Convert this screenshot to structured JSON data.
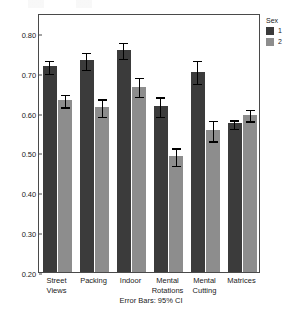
{
  "chart_data": {
    "type": "bar",
    "title": "",
    "xlabel": "",
    "ylabel": "Mean",
    "ylim": [
      0.2,
      0.85
    ],
    "ytick_values": [
      0.8,
      0.7,
      0.6,
      0.5,
      0.4,
      0.3,
      0.2
    ],
    "ytick_labels": [
      "0.80",
      "0.70",
      "0.60",
      "0.50",
      "0.40",
      "0.30",
      "0.20"
    ],
    "grid": false,
    "legend_position": "right",
    "legend_title": "Sex",
    "categories": [
      "Street Views",
      "Packing",
      "Indoor",
      "Mental Rotations",
      "Mental Cutting",
      "Matrices"
    ],
    "category_lines": [
      [
        "Street",
        "Views"
      ],
      [
        "Packing"
      ],
      [
        "Indoor"
      ],
      [
        "Mental",
        "Rotations"
      ],
      [
        "Mental",
        "Cutting"
      ],
      [
        "Matrices"
      ]
    ],
    "series": [
      {
        "name": "1",
        "color": "#3b3b3b",
        "values": [
          0.716,
          0.732,
          0.757,
          0.617,
          0.703,
          0.573
        ],
        "ci_low": [
          0.7,
          0.71,
          0.738,
          0.592,
          0.675,
          0.563
        ],
        "ci_high": [
          0.733,
          0.754,
          0.778,
          0.642,
          0.733,
          0.584
        ]
      },
      {
        "name": "2",
        "color": "#8d8d8d",
        "values": [
          0.632,
          0.613,
          0.665,
          0.492,
          0.556,
          0.595
        ],
        "ci_low": [
          0.617,
          0.592,
          0.643,
          0.47,
          0.531,
          0.581
        ],
        "ci_high": [
          0.648,
          0.637,
          0.69,
          0.514,
          0.583,
          0.61
        ]
      }
    ],
    "annotation": "Error Bars: 95% CI",
    "error_bar_type": "95% CI"
  },
  "legend": {
    "title": "Sex",
    "entries": [
      {
        "label": "1",
        "color": "#3b3b3b"
      },
      {
        "label": "2",
        "color": "#8d8d8d"
      }
    ]
  },
  "axes": {
    "y_label": "Mean",
    "y_ticks": [
      "0.80",
      "0.70",
      "0.60",
      "0.50",
      "0.40",
      "0.30",
      "0.20"
    ]
  },
  "footnote": "Error Bars: 95% CI"
}
